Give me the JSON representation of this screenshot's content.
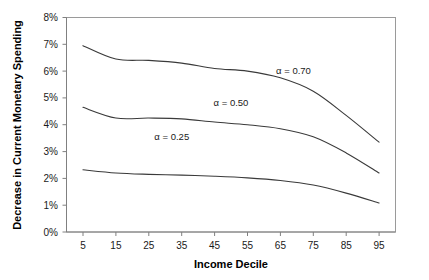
{
  "chart_data": {
    "type": "line",
    "title": "",
    "xlabel": "Income Decile",
    "ylabel": "Decrease in Current Monetary Spending",
    "x": [
      5,
      15,
      25,
      35,
      45,
      55,
      65,
      75,
      85,
      95
    ],
    "xlim": [
      0,
      100
    ],
    "ylim": [
      0,
      8
    ],
    "yticks": [
      0,
      1,
      2,
      3,
      4,
      5,
      6,
      7,
      8
    ],
    "ytick_labels": [
      "0%",
      "1%",
      "2%",
      "3%",
      "4%",
      "5%",
      "6%",
      "7%",
      "8%"
    ],
    "xtick_labels": [
      "5",
      "15",
      "25",
      "35",
      "45",
      "55",
      "65",
      "75",
      "85",
      "95"
    ],
    "grid": false,
    "legend_position": "inline-annotations",
    "series": [
      {
        "name": "α = 0.70",
        "label": "α = 0.70",
        "values": [
          6.95,
          6.45,
          6.4,
          6.3,
          6.1,
          6.0,
          5.75,
          5.25,
          4.35,
          3.35
        ],
        "color": "#3a3a3a"
      },
      {
        "name": "α = 0.50",
        "label": "α = 0.50",
        "values": [
          4.65,
          4.25,
          4.25,
          4.22,
          4.1,
          4.0,
          3.85,
          3.55,
          2.95,
          2.2
        ],
        "color": "#3a3a3a"
      },
      {
        "name": "α = 0.25",
        "label": "α = 0.25",
        "values": [
          2.32,
          2.2,
          2.15,
          2.12,
          2.08,
          2.02,
          1.92,
          1.75,
          1.45,
          1.08
        ],
        "color": "#3a3a3a"
      }
    ],
    "annotations": [
      {
        "text": "α = 0.70",
        "x": 69,
        "y": 5.9
      },
      {
        "text": "α = 0.50",
        "x": 50,
        "y": 4.7
      },
      {
        "text": "α = 0.25",
        "x": 32,
        "y": 3.45
      }
    ]
  },
  "axes": {
    "y_title": "Decrease in Current Monetary Spending",
    "x_title": "Income Decile",
    "y_ticks": [
      "8%",
      "7%",
      "6%",
      "5%",
      "4%",
      "3%",
      "2%",
      "1%",
      "0%"
    ],
    "x_ticks": [
      "5",
      "15",
      "25",
      "35",
      "45",
      "55",
      "65",
      "75",
      "85",
      "95"
    ]
  },
  "colors": {
    "line": "#3a3a3a",
    "axis": "#808080",
    "frame": "#9a9a9a",
    "text": "#1a1a1a",
    "background": "#ffffff"
  }
}
